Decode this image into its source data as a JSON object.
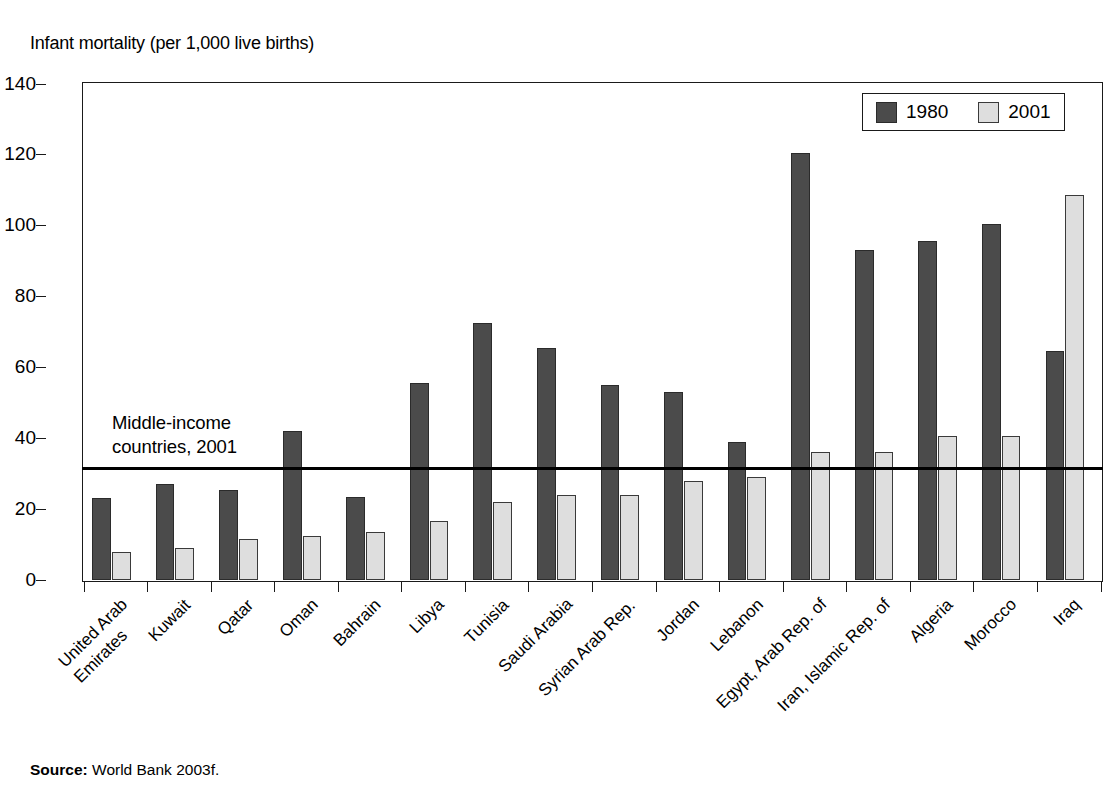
{
  "figure": {
    "title": "Infant mortality (per 1,000 live births)",
    "source_label": "Source:",
    "source_text": "World Bank 2003f."
  },
  "legend": {
    "entries": [
      {
        "label": "1980",
        "color": "#4b4b4b"
      },
      {
        "label": "2001",
        "color": "#dedede"
      }
    ]
  },
  "annotation": {
    "text": "Middle-income\ncountries, 2001",
    "value": 32
  },
  "axis": {
    "y_ticks": [
      "0",
      "20",
      "40",
      "60",
      "80",
      "100",
      "120",
      "140"
    ],
    "y_min": 0,
    "y_max": 140
  },
  "chart_data": {
    "type": "bar",
    "title": "Infant mortality (per 1,000 live births)",
    "xlabel": "",
    "ylabel": "Infant mortality (per 1,000 live births)",
    "ylim": [
      0,
      140
    ],
    "ytick_step": 20,
    "grid": false,
    "legend_position": "top-right",
    "categories": [
      "United Arab Emirates",
      "Kuwait",
      "Qatar",
      "Oman",
      "Bahrain",
      "Libya",
      "Tunisia",
      "Saudi Arabia",
      "Syrian Arab Rep.",
      "Jordan",
      "Lebanon",
      "Egypt, Arab Rep. of",
      "Iran, Islamic Rep. of",
      "Algeria",
      "Morocco",
      "Iraq"
    ],
    "category_lines": [
      [
        "United Arab",
        "Emirates"
      ],
      [
        "Kuwait"
      ],
      [
        "Qatar"
      ],
      [
        "Oman"
      ],
      [
        "Bahrain"
      ],
      [
        "Libya"
      ],
      [
        "Tunisia"
      ],
      [
        "Saudi Arabia"
      ],
      [
        "Syrian Arab Rep."
      ],
      [
        "Jordan"
      ],
      [
        "Lebanon"
      ],
      [
        "Egypt, Arab Rep. of"
      ],
      [
        "Iran, Islamic Rep. of"
      ],
      [
        "Algeria"
      ],
      [
        "Morocco"
      ],
      [
        "Iraq"
      ]
    ],
    "series": [
      {
        "name": "1980",
        "color": "#4b4b4b",
        "values": [
          23,
          27,
          25.5,
          42,
          23.5,
          55.5,
          72.5,
          65.5,
          55,
          53,
          39,
          120.5,
          93,
          95.5,
          100.5,
          64.5
        ]
      },
      {
        "name": "2001",
        "color": "#dedede",
        "values": [
          8,
          9,
          11.5,
          12.5,
          13.5,
          16.5,
          22,
          24,
          24,
          28,
          29,
          36,
          36,
          40.5,
          40.5,
          108.5
        ]
      }
    ],
    "reference_line": {
      "label": "Middle-income countries, 2001",
      "value": 32
    }
  }
}
